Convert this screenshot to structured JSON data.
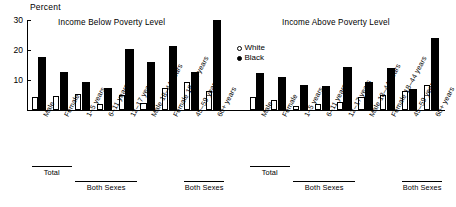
{
  "chart_data": {
    "type": "bar",
    "title": "",
    "ylabel": "Percent",
    "xlabel": "",
    "ylim": [
      0,
      30
    ],
    "yticks": [
      10,
      20,
      30
    ],
    "grid": false,
    "legend_position": "top-center",
    "legend": [
      {
        "label": "White",
        "marker": "open-circle"
      },
      {
        "label": "Black",
        "marker": "filled-circle"
      }
    ],
    "categories": [
      "Male",
      "Female",
      "1–5 years",
      "6–11 years",
      "12–17 years",
      "Male 18–44 years",
      "Female 18–44 years",
      "45–59 years",
      "60+ years"
    ],
    "category_groups": [
      {
        "label": "Total",
        "start": 0,
        "end": 1
      },
      {
        "label": "Both Sexes",
        "start": 2,
        "end": 4
      },
      {
        "label": "Both Sexes",
        "start": 7,
        "end": 8
      }
    ],
    "panels": [
      {
        "title": "Income Below Poverty Level",
        "series": [
          {
            "name": "White",
            "values": [
              4.5,
              4.8,
              5.5,
              2.0,
              5.0,
              2.3,
              7.5,
              9.5,
              6.5
            ]
          },
          {
            "name": "Black",
            "values": [
              17.8,
              12.8,
              9.5,
              7.5,
              20.5,
              16.0,
              21.5,
              12.8,
              30.0
            ]
          }
        ]
      },
      {
        "title": "Income Above Poverty Level",
        "series": [
          {
            "name": "White",
            "values": [
              4.5,
              3.5,
              1.5,
              2.0,
              2.8,
              4.5,
              5.0,
              6.5,
              8.5
            ]
          },
          {
            "name": "Black",
            "values": [
              12.5,
              11.0,
              8.5,
              8.0,
              14.5,
              9.5,
              14.0,
              7.0,
              24.0
            ]
          }
        ]
      }
    ]
  }
}
